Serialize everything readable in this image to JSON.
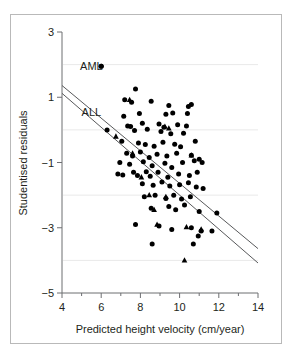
{
  "figure": {
    "frame_color": "#b9b9b9",
    "background": "#ffffff"
  },
  "chart_data": {
    "type": "scatter",
    "title": "",
    "xlabel": "Predicted height velocity (cm/year)",
    "ylabel": "Studentised residuals",
    "xlim": [
      4,
      14
    ],
    "ylim": [
      -5,
      3
    ],
    "xticks": [
      4,
      6,
      8,
      10,
      12,
      14
    ],
    "xtick_labels": [
      "4",
      "6",
      "8",
      "10",
      "12",
      "14"
    ],
    "xminor_ticks": [
      5,
      7,
      9,
      11,
      13
    ],
    "yticks": [
      3,
      1,
      -1,
      -3,
      -5
    ],
    "ytick_labels": [
      "3",
      "1",
      "−1",
      "−3",
      "−5"
    ],
    "grid": true,
    "gridlines_y": [
      2,
      0,
      -2,
      -4
    ],
    "grid_color": "#e9e9e9",
    "legend_position": "inside-upper-left",
    "marker_color": "#000000",
    "line_color": "#58595b",
    "annotations": [
      {
        "text": "AML",
        "x": 5.5,
        "y": 1.95,
        "marker": "circle",
        "marker_x": 6.0,
        "marker_y": 1.95
      },
      {
        "text": "ALL",
        "x": 5.5,
        "y": 0.55,
        "marker": "none"
      }
    ],
    "series": [
      {
        "name": "AML",
        "marker": "circle",
        "fit_line": {
          "x": [
            4,
            14
          ],
          "y": [
            1.36,
            -3.64
          ]
        },
        "points": [
          [
            6.0,
            1.95
          ],
          [
            7.75,
            1.25
          ],
          [
            7.2,
            0.92
          ],
          [
            7.55,
            0.85
          ],
          [
            8.55,
            0.88
          ],
          [
            9.45,
            0.75
          ],
          [
            10.45,
            0.72
          ],
          [
            10.6,
            0.78
          ],
          [
            7.15,
            0.42
          ],
          [
            7.95,
            0.5
          ],
          [
            9.3,
            0.48
          ],
          [
            9.65,
            0.52
          ],
          [
            10.4,
            0.5
          ],
          [
            7.35,
            0.12
          ],
          [
            7.5,
            0.1
          ],
          [
            8.1,
            0.2
          ],
          [
            8.95,
            0.18
          ],
          [
            9.2,
            0.08
          ],
          [
            9.9,
            0.16
          ],
          [
            10.35,
            0.12
          ],
          [
            6.3,
            0.0
          ],
          [
            7.7,
            -0.02
          ],
          [
            8.35,
            0.02
          ],
          [
            9.05,
            -0.05
          ],
          [
            9.55,
            -0.12
          ],
          [
            10.2,
            -0.1
          ],
          [
            7.05,
            -0.35
          ],
          [
            7.9,
            -0.4
          ],
          [
            8.25,
            -0.45
          ],
          [
            8.7,
            -0.5
          ],
          [
            9.15,
            -0.38
          ],
          [
            9.75,
            -0.44
          ],
          [
            10.05,
            -0.52
          ],
          [
            10.8,
            -0.35
          ],
          [
            7.3,
            -0.72
          ],
          [
            7.6,
            -0.8
          ],
          [
            8.0,
            -0.68
          ],
          [
            8.45,
            -0.85
          ],
          [
            8.85,
            -0.75
          ],
          [
            9.35,
            -0.8
          ],
          [
            9.85,
            -0.72
          ],
          [
            10.6,
            -0.78
          ],
          [
            11.0,
            -0.9
          ],
          [
            6.95,
            -1.0
          ],
          [
            7.45,
            -1.05
          ],
          [
            8.15,
            -0.98
          ],
          [
            8.6,
            -1.1
          ],
          [
            9.25,
            -1.02
          ],
          [
            9.6,
            -1.15
          ],
          [
            10.15,
            -1.0
          ],
          [
            10.75,
            -0.95
          ],
          [
            11.15,
            -1.0
          ],
          [
            6.85,
            -1.35
          ],
          [
            7.1,
            -1.38
          ],
          [
            7.65,
            -1.3
          ],
          [
            7.85,
            -1.4
          ],
          [
            8.3,
            -1.28
          ],
          [
            8.5,
            -1.42
          ],
          [
            8.9,
            -1.3
          ],
          [
            9.4,
            -1.45
          ],
          [
            9.95,
            -1.35
          ],
          [
            10.5,
            -1.4
          ],
          [
            10.9,
            -1.3
          ],
          [
            8.1,
            -1.65
          ],
          [
            8.65,
            -1.7
          ],
          [
            9.1,
            -1.6
          ],
          [
            9.5,
            -1.72
          ],
          [
            10.0,
            -1.68
          ],
          [
            10.45,
            -1.62
          ],
          [
            10.85,
            -1.75
          ],
          [
            11.2,
            -1.8
          ],
          [
            8.2,
            -2.05
          ],
          [
            8.75,
            -2.0
          ],
          [
            9.3,
            -2.1
          ],
          [
            9.7,
            -2.0
          ],
          [
            10.1,
            -2.12
          ],
          [
            10.55,
            -2.05
          ],
          [
            8.55,
            -2.4
          ],
          [
            9.45,
            -2.35
          ],
          [
            9.8,
            -2.45
          ],
          [
            10.25,
            -2.3
          ],
          [
            11.0,
            -2.5
          ],
          [
            11.9,
            -2.55
          ],
          [
            7.75,
            -2.9
          ],
          [
            8.95,
            -2.95
          ],
          [
            9.6,
            -3.05
          ],
          [
            10.6,
            -3.0
          ],
          [
            11.1,
            -3.1
          ],
          [
            11.65,
            -3.1
          ],
          [
            8.6,
            -3.5
          ],
          [
            10.7,
            -3.5
          ],
          [
            10.95,
            -3.25
          ]
        ]
      },
      {
        "name": "ALL",
        "marker": "triangle",
        "fit_line": {
          "x": [
            4,
            14
          ],
          "y": [
            1.12,
            -4.08
          ]
        },
        "points": [
          [
            7.45,
            0.92
          ],
          [
            9.25,
            0.1
          ],
          [
            9.45,
            0.05
          ],
          [
            6.75,
            -0.2
          ],
          [
            7.6,
            -0.72
          ],
          [
            10.6,
            -0.78
          ],
          [
            8.05,
            -1.45
          ],
          [
            8.45,
            -2.0
          ],
          [
            9.3,
            -2.05
          ],
          [
            8.7,
            -2.45
          ],
          [
            8.85,
            -2.9
          ],
          [
            10.35,
            -2.98
          ],
          [
            11.1,
            -3.05
          ],
          [
            10.25,
            -4.0
          ]
        ]
      }
    ]
  }
}
